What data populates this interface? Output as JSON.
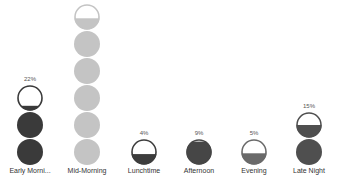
{
  "chart_data": {
    "type": "pictograph",
    "title": "",
    "xlabel": "",
    "ylabel": "",
    "categories": [
      "Early Morni...",
      "Mid-Morning",
      "Lunchtime",
      "Afternoon",
      "Evening",
      "Late Night"
    ],
    "full_categories": [
      "Early Morning",
      "Mid-Morning",
      "Lunchtime",
      "Afternoon",
      "Evening",
      "Late Night"
    ],
    "values": [
      22,
      44,
      4,
      9,
      5,
      15
    ],
    "value_labels": [
      "22%",
      "44%",
      "4%",
      "9%",
      "5%",
      "15%"
    ],
    "unit": "%",
    "icon_shape": "circle",
    "columns": [
      {
        "label": "Early Morni...",
        "pct": "22%",
        "color": "#3a3a3a",
        "full_icons": 2,
        "partial_fill": 0.2
      },
      {
        "label": "Mid-Morning",
        "pct": "44%",
        "color": "#c4c4c4",
        "full_icons": 5,
        "partial_fill": 0.45
      },
      {
        "label": "Lunchtime",
        "pct": "4%",
        "color": "#3d3d3d",
        "full_icons": 0,
        "partial_fill": 0.42
      },
      {
        "label": "Afternoon",
        "pct": "9%",
        "color": "#464646",
        "full_icons": 0,
        "partial_fill": 0.9
      },
      {
        "label": "Evening",
        "pct": "5%",
        "color": "#6a6a6a",
        "full_icons": 0,
        "partial_fill": 0.45
      },
      {
        "label": "Late Night",
        "pct": "15%",
        "color": "#4f4f4f",
        "full_icons": 1,
        "partial_fill": 0.5
      }
    ]
  }
}
